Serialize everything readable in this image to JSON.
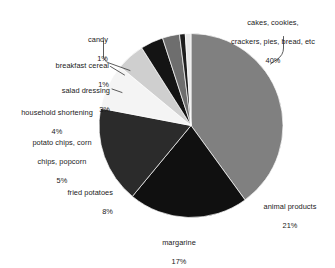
{
  "chart_data": {
    "type": "pie",
    "title": "",
    "subtitle": "",
    "xlabel": "",
    "ylabel": "",
    "legend_position": "labels-with-leader-lines",
    "grid": false,
    "units": "percent",
    "total": 100,
    "categories": [
      "cakes, cookies, crackers, pies, bread, etc",
      "animal products",
      "margarine",
      "fried potatoes",
      "potato chips, corn chips, popcorn",
      "household shortening",
      "salad dressing",
      "breakfast cereal",
      "candy"
    ],
    "values": [
      40,
      21,
      17,
      8,
      5,
      4,
      3,
      1,
      1
    ],
    "slices": [
      {
        "key": "cakes",
        "label_line1": "cakes, cookies,",
        "label_line2": "crackers, pies, bread, etc",
        "label_line3": "",
        "percent_text": "40%",
        "value": 40,
        "color": "#808080"
      },
      {
        "key": "animal-products",
        "label_line1": "animal products",
        "label_line2": "",
        "label_line3": "",
        "percent_text": "21%",
        "value": 21,
        "color": "#101010"
      },
      {
        "key": "margarine",
        "label_line1": "margarine",
        "label_line2": "",
        "label_line3": "",
        "percent_text": "17%",
        "value": 17,
        "color": "#2b2b2b"
      },
      {
        "key": "fried-potatoes",
        "label_line1": "fried potatoes",
        "label_line2": "",
        "label_line3": "",
        "percent_text": "8%",
        "value": 8,
        "color": "#f4f4f4"
      },
      {
        "key": "potato-chips",
        "label_line1": "potato chips, corn",
        "label_line2": "chips, popcorn",
        "label_line3": "",
        "percent_text": "5%",
        "value": 5,
        "color": "#cfcfcf"
      },
      {
        "key": "household-shortening",
        "label_line1": "household shortening",
        "label_line2": "",
        "label_line3": "",
        "percent_text": "4%",
        "value": 4,
        "color": "#141414"
      },
      {
        "key": "salad-dressing",
        "label_line1": "salad dressing",
        "label_line2": "",
        "label_line3": "",
        "percent_text": "3%",
        "value": 3,
        "color": "#6e6e6e"
      },
      {
        "key": "breakfast-cereal",
        "label_line1": "breakfast cereal",
        "label_line2": "",
        "label_line3": "",
        "percent_text": "1%",
        "value": 1,
        "color": "#1d1d1d"
      },
      {
        "key": "candy",
        "label_line1": "candy",
        "label_line2": "",
        "label_line3": "",
        "percent_text": "1%",
        "value": 1,
        "color": "#e8e8e8"
      }
    ],
    "geometry": {
      "center_x": 191,
      "center_y": 125.5,
      "radius": 92,
      "start_angle_deg": -90,
      "direction": "clockwise"
    },
    "colors": {
      "background": "#ffffff",
      "text": "#1a1a1a",
      "leader_line": "#4a4a4a",
      "slice_edge": "#ffffff"
    }
  }
}
